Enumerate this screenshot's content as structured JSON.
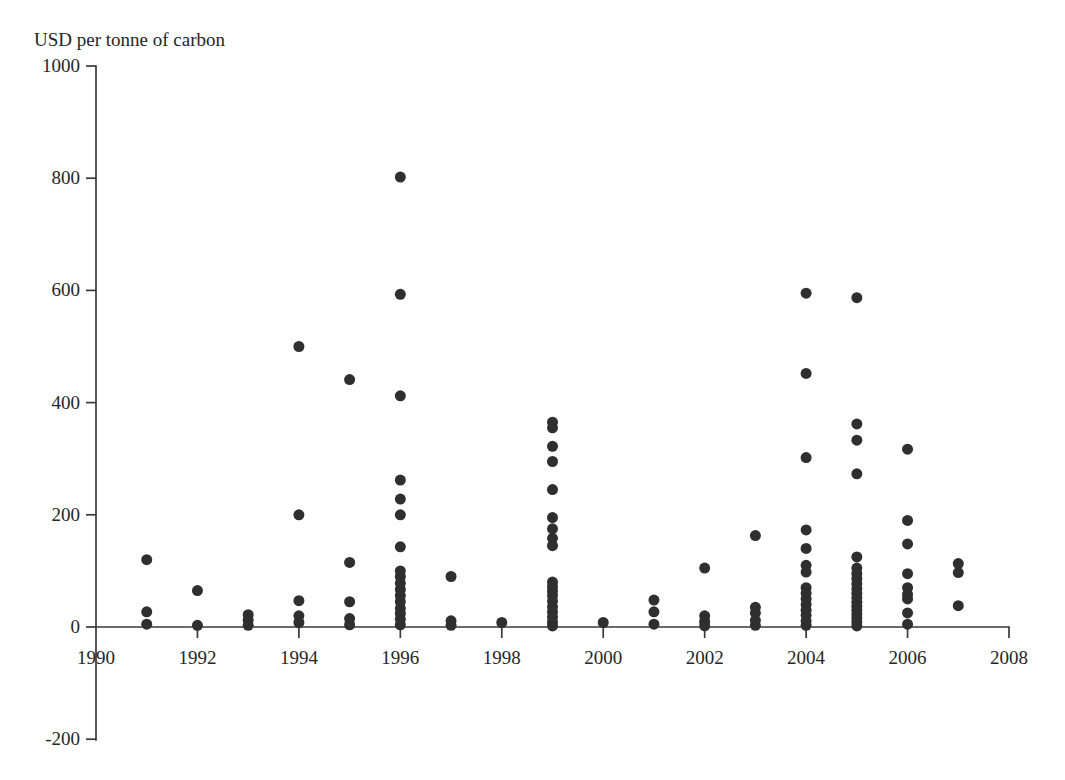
{
  "chart_data": {
    "type": "scatter",
    "title": "",
    "ylabel": "USD per tonne of carbon",
    "xlabel": "",
    "xlim": [
      1990,
      2008
    ],
    "ylim": [
      -200,
      1000
    ],
    "xticks": [
      1990,
      1992,
      1994,
      1996,
      1998,
      2000,
      2002,
      2004,
      2006,
      2008
    ],
    "yticks": [
      -200,
      0,
      200,
      400,
      600,
      800,
      1000
    ],
    "xtick_labels": [
      "1990",
      "1992",
      "1994",
      "1996",
      "1998",
      "2000",
      "2002",
      "2004",
      "2006",
      "2008"
    ],
    "ytick_labels": [
      "-200",
      "0",
      "200",
      "400",
      "600",
      "800",
      "1000"
    ],
    "grid": false,
    "legend": null,
    "marker": {
      "shape": "circle",
      "color": "#2f2f2f",
      "size": 11
    },
    "x": [
      1991,
      1991,
      1991,
      1992,
      1992,
      1993,
      1993,
      1993,
      1994,
      1994,
      1994,
      1994,
      1994,
      1995,
      1995,
      1995,
      1995,
      1995,
      1996,
      1996,
      1996,
      1996,
      1996,
      1996,
      1996,
      1996,
      1996,
      1996,
      1996,
      1996,
      1996,
      1996,
      1996,
      1996,
      1996,
      1997,
      1997,
      1997,
      1998,
      1999,
      1999,
      1999,
      1999,
      1999,
      1999,
      1999,
      1999,
      1999,
      1999,
      1999,
      1999,
      1999,
      1999,
      1999,
      1999,
      1999,
      1999,
      1999,
      2000,
      2001,
      2001,
      2001,
      2002,
      2002,
      2002,
      2002,
      2003,
      2003,
      2003,
      2003,
      2003,
      2004,
      2004,
      2004,
      2004,
      2004,
      2004,
      2004,
      2004,
      2004,
      2004,
      2004,
      2004,
      2004,
      2004,
      2004,
      2005,
      2005,
      2005,
      2005,
      2005,
      2005,
      2005,
      2005,
      2005,
      2005,
      2005,
      2005,
      2005,
      2005,
      2005,
      2005,
      2005,
      2005,
      2005,
      2006,
      2006,
      2006,
      2006,
      2006,
      2006,
      2006,
      2006,
      2006,
      2007,
      2007,
      2007
    ],
    "y": [
      120,
      27,
      5,
      65,
      3,
      22,
      12,
      3,
      500,
      200,
      47,
      20,
      8,
      441,
      115,
      45,
      15,
      4,
      802,
      593,
      412,
      262,
      228,
      200,
      143,
      100,
      90,
      78,
      67,
      56,
      45,
      33,
      24,
      14,
      4,
      90,
      11,
      3,
      8,
      365,
      355,
      322,
      295,
      245,
      195,
      175,
      158,
      145,
      80,
      72,
      64,
      56,
      46,
      36,
      27,
      18,
      9,
      2,
      8,
      48,
      27,
      5,
      105,
      20,
      10,
      2,
      163,
      35,
      25,
      12,
      3,
      595,
      452,
      302,
      173,
      140,
      110,
      98,
      70,
      60,
      50,
      40,
      30,
      21,
      11,
      3,
      587,
      362,
      333,
      273,
      125,
      105,
      95,
      86,
      77,
      68,
      60,
      52,
      44,
      37,
      30,
      23,
      16,
      9,
      2,
      317,
      190,
      148,
      95,
      70,
      58,
      50,
      25,
      5,
      113,
      97,
      38
    ],
    "series_note": "Each marker is one published estimate of the social cost of carbon, plotted against its year of publication."
  },
  "axes": {
    "y_axis_label": "USD per tonne of carbon"
  }
}
